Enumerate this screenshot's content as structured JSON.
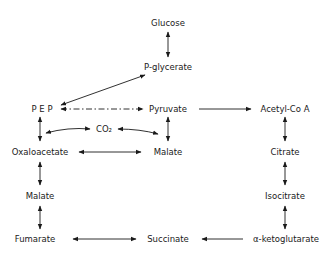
{
  "nodes": {
    "glucose": "Glucose",
    "p_glycerate": "P-glycerate",
    "pep": "P E P",
    "pyruvate": "Pyruvate",
    "acetyl_coa": "Acetyl-Co A",
    "co2": "CO₂",
    "oxaloacetate": "Oxaloacetate",
    "malate_mid": "Malate",
    "citrate": "Citrate",
    "malate_left": "Malate",
    "isocitrate": "Isocitrate",
    "fumarate": "Fumarate",
    "succinate": "Succinate",
    "alpha_ketoglutarate": "α-ketoglutarate"
  },
  "edges": [
    {
      "from": "Glucose",
      "to": "P-glycerate",
      "type": "bidirectional"
    },
    {
      "from": "P-glycerate",
      "to": "PEP",
      "type": "bidirectional"
    },
    {
      "from": "PEP",
      "to": "Pyruvate",
      "type": "bidirectional-dashdot"
    },
    {
      "from": "Pyruvate",
      "to": "Acetyl-CoA",
      "type": "forward"
    },
    {
      "from": "PEP",
      "to": "Oxaloacetate",
      "type": "bidirectional"
    },
    {
      "from": "Oxaloacetate",
      "to": "CO2",
      "type": "bidirectional"
    },
    {
      "from": "CO2",
      "to": "Malate",
      "type": "bidirectional"
    },
    {
      "from": "Pyruvate",
      "to": "Malate",
      "type": "bidirectional"
    },
    {
      "from": "Oxaloacetate",
      "to": "Malate",
      "type": "bidirectional"
    },
    {
      "from": "Acetyl-CoA",
      "to": "Citrate",
      "type": "bidirectional"
    },
    {
      "from": "Oxaloacetate",
      "to": "Malate (left)",
      "type": "bidirectional"
    },
    {
      "from": "Citrate",
      "to": "Isocitrate",
      "type": "bidirectional"
    },
    {
      "from": "Malate (left)",
      "to": "Fumarate",
      "type": "bidirectional"
    },
    {
      "from": "Isocitrate",
      "to": "alpha-ketoglutarate",
      "type": "bidirectional"
    },
    {
      "from": "Fumarate",
      "to": "Succinate",
      "type": "bidirectional"
    },
    {
      "from": "alpha-ketoglutarate",
      "to": "Succinate",
      "type": "forward"
    }
  ],
  "colors": {
    "ink": "#1a1a1a",
    "background": "#ffffff"
  }
}
